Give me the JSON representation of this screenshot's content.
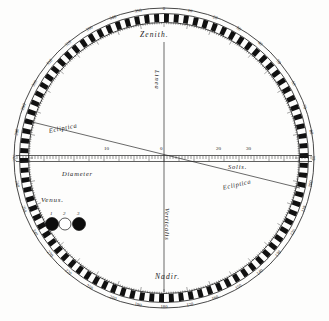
{
  "plate": {
    "title": "Astronomical observation plate",
    "background_color": "#fdfdfc",
    "ink_color": "#111111"
  },
  "circle": {
    "center_x": 164,
    "center_y": 158,
    "outer_radius": 150,
    "ring_outer_radius": 144,
    "ring_inner_radius": 136,
    "degree_tick_count": 180
  },
  "labels": {
    "zenith": "Zenith.",
    "nadir": "Nadir.",
    "linea": "Linea",
    "verticalis": "Verticalis",
    "ecliptica_upper": "Ecliptica",
    "ecliptica_lower": "Ecliptica",
    "diameter": "Diameter",
    "solis": "Solis.",
    "venus": "Venus."
  },
  "diameter_scale": {
    "label": "Diameter Solis",
    "ticks": [
      {
        "value": "0",
        "x": 164
      },
      {
        "value": "10",
        "x": 108
      },
      {
        "value": "20",
        "x": 220
      },
      {
        "value": "30",
        "x": 250
      }
    ],
    "left_number": "10",
    "center_number": "0",
    "right_numbers": [
      "20",
      "30"
    ],
    "minor_tick_spacing_px": 3
  },
  "venus_positions": [
    {
      "id": "1",
      "label": "1",
      "cx": 52,
      "cy": 224,
      "r": 6.5,
      "fill": "#0d0d0d"
    },
    {
      "id": "2",
      "label": "2",
      "cx": 65,
      "cy": 224,
      "r": 6.0,
      "fill": "#ffffff"
    },
    {
      "id": "3",
      "label": "3",
      "cx": 79,
      "cy": 224,
      "r": 6.5,
      "fill": "#0d0d0d"
    }
  ],
  "degree_ring_numerals": {
    "top": [
      "350",
      "340",
      "330",
      "0",
      "10",
      "20",
      "30"
    ],
    "right": [
      "60",
      "70",
      "80",
      "90",
      "100",
      "110"
    ],
    "bottom": [
      "170",
      "180",
      "190",
      "200",
      "210"
    ],
    "left": [
      "250",
      "260",
      "270",
      "280",
      "290"
    ]
  }
}
